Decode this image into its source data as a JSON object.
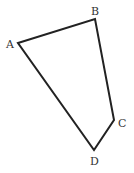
{
  "diagram": {
    "type": "quadrilateral",
    "stroke_color": "#222222",
    "label_color": "#333333",
    "background": "#ffffff",
    "vertices": [
      {
        "name": "A",
        "x": 18,
        "y": 43,
        "label_x": 6,
        "label_y": 48
      },
      {
        "name": "B",
        "x": 95,
        "y": 19,
        "label_x": 91,
        "label_y": 15
      },
      {
        "name": "C",
        "x": 114,
        "y": 120,
        "label_x": 118,
        "label_y": 127
      },
      {
        "name": "D",
        "x": 94,
        "y": 150,
        "label_x": 90,
        "label_y": 165
      }
    ],
    "edges": [
      [
        "A",
        "B"
      ],
      [
        "B",
        "C"
      ],
      [
        "C",
        "D"
      ],
      [
        "D",
        "A"
      ]
    ]
  }
}
